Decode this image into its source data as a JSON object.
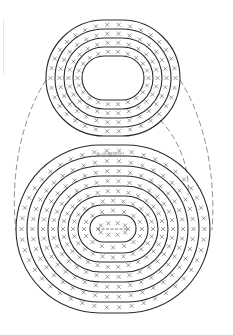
{
  "diagram": {
    "type": "crochet-chart",
    "stitch_symbol": "X",
    "increase_symbol": "V-X",
    "colors": {
      "ring": "#2a2a2a",
      "stitch": "#555555",
      "dashed": "#777777",
      "label": "#777777"
    },
    "upper_oval": {
      "name": "top-piece",
      "rounds": 4,
      "center": [
        113,
        78
      ]
    },
    "lower_oval": {
      "name": "bottom-piece",
      "rounds": 7,
      "center": [
        113,
        229
      ],
      "label": "⑧-⑪増減なし"
    },
    "round_markers_upper": [
      "①",
      "②",
      "③",
      "④"
    ],
    "round_markers_lower": [
      "①",
      "②",
      "③",
      "④",
      "⑤",
      "⑥",
      "⑦"
    ],
    "chain_start": "-----"
  }
}
